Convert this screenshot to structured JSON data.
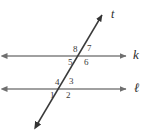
{
  "figure": {
    "type": "geometry-diagram",
    "background_color": "#ffffff",
    "line_color": "#808080",
    "transversal_color": "#3a3a3a",
    "label_color": "#3a3a3a",
    "width": 149,
    "height": 132
  },
  "lines": {
    "parallel_upper": {
      "name": "k",
      "label": "k",
      "y": 56,
      "x_start": 6,
      "x_end": 127,
      "arrows": "both"
    },
    "parallel_lower": {
      "name": "l",
      "label": "ℓ",
      "y": 89,
      "x_start": 6,
      "x_end": 127,
      "arrows": "both"
    },
    "transversal": {
      "name": "t",
      "label": "t",
      "x_start": 37,
      "y_start": 125,
      "x_end": 103,
      "y_end": 13,
      "arrows": "both"
    }
  },
  "line_labels": {
    "transversal": "t",
    "upper": "k",
    "lower": "ℓ"
  },
  "intersections": {
    "upper": {
      "x": 82,
      "y": 56,
      "with": "k"
    },
    "lower": {
      "x": 64,
      "y": 89,
      "with": "ℓ"
    }
  },
  "angles": [
    {
      "id": "angle-8",
      "label": "8",
      "x": 73,
      "y": 45,
      "intersection": "upper",
      "position": "upper-left"
    },
    {
      "id": "angle-7",
      "label": "7",
      "x": 87,
      "y": 44,
      "intersection": "upper",
      "position": "upper-right"
    },
    {
      "id": "angle-5",
      "label": "5",
      "x": 68,
      "y": 58,
      "intersection": "upper",
      "position": "lower-left"
    },
    {
      "id": "angle-6",
      "label": "6",
      "x": 84,
      "y": 58,
      "intersection": "upper",
      "position": "lower-right"
    },
    {
      "id": "angle-4",
      "label": "4",
      "x": 55,
      "y": 78,
      "intersection": "lower",
      "position": "upper-left"
    },
    {
      "id": "angle-3",
      "label": "3",
      "x": 69,
      "y": 77,
      "intersection": "lower",
      "position": "upper-right"
    },
    {
      "id": "angle-1",
      "label": "1",
      "x": 50,
      "y": 91,
      "intersection": "lower",
      "position": "lower-left"
    },
    {
      "id": "angle-2",
      "label": "2",
      "x": 66,
      "y": 91,
      "intersection": "lower",
      "position": "lower-right"
    }
  ]
}
